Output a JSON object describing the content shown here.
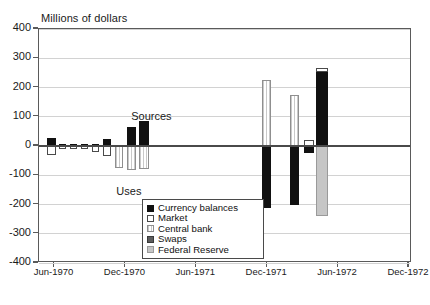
{
  "chart_data": {
    "type": "bar",
    "title": "",
    "ylabel": "Millions of dollars",
    "xlabel": "",
    "ylim": [
      -400,
      400
    ],
    "ytick_values": [
      400,
      300,
      200,
      100,
      0,
      -100,
      -200,
      -300,
      -400
    ],
    "ytick_labels": [
      "400",
      "300",
      "200",
      "100",
      "0",
      "-100",
      "-200",
      "-300",
      "-400"
    ],
    "xtick_labels": [
      "Jun-1970",
      "Dec-1970",
      "Jun-1971",
      "Dec-1971",
      "Jun-1972",
      "Dec-1972"
    ],
    "grid": true,
    "legend_position": "lower-center",
    "annotations": [
      {
        "text": "Sources",
        "x": 0.25,
        "y": 95
      },
      {
        "text": "Uses",
        "x": 0.21,
        "y": -160
      }
    ],
    "series": [
      {
        "name": "Currency balances",
        "color": "#111111",
        "key": "currency"
      },
      {
        "name": "Market",
        "color": "#ffffff",
        "key": "market"
      },
      {
        "name": "Central bank",
        "color": "#dddddd",
        "key": "central"
      },
      {
        "name": "Swaps",
        "color": "#5c5c5c",
        "key": "swaps"
      },
      {
        "name": "Federal Reserve",
        "color": "#c6c6c6",
        "key": "fed"
      }
    ],
    "bars": [
      {
        "series": "currency",
        "x": 45.5,
        "w": 9,
        "v0": 0,
        "v1": 27
      },
      {
        "series": "market",
        "x": 45.5,
        "w": 9,
        "v0": 0,
        "v1": -30
      },
      {
        "series": "currency",
        "x": 57.5,
        "w": 7.5,
        "v0": 0,
        "v1": 6
      },
      {
        "series": "market",
        "x": 57.5,
        "w": 7.5,
        "v0": 0,
        "v1": -9
      },
      {
        "series": "currency",
        "x": 68.5,
        "w": 7.5,
        "v0": 0,
        "v1": 7
      },
      {
        "series": "market",
        "x": 68.5,
        "w": 7.5,
        "v0": 0,
        "v1": -11
      },
      {
        "series": "currency",
        "x": 79.5,
        "w": 7.5,
        "v0": 0,
        "v1": 7
      },
      {
        "series": "market",
        "x": 79.5,
        "w": 7.5,
        "v0": 0,
        "v1": -9
      },
      {
        "series": "currency",
        "x": 90.5,
        "w": 7.5,
        "v0": 0,
        "v1": 7
      },
      {
        "series": "market",
        "x": 90.5,
        "w": 7.5,
        "v0": 0,
        "v1": -22
      },
      {
        "series": "currency",
        "x": 102,
        "w": 8,
        "v0": 0,
        "v1": 25
      },
      {
        "series": "market",
        "x": 102,
        "w": 8,
        "v0": 0,
        "v1": -34
      },
      {
        "series": "currency",
        "x": 114,
        "w": 8,
        "v0": 0,
        "v1": 4
      },
      {
        "series": "central",
        "x": 114,
        "w": 8,
        "v0": 0,
        "v1": -76
      },
      {
        "series": "currency",
        "x": 125.5,
        "w": 9,
        "v0": 0,
        "v1": 66
      },
      {
        "series": "central",
        "x": 125.5,
        "w": 9,
        "v0": 0,
        "v1": -81
      },
      {
        "series": "currency",
        "x": 138,
        "w": 10,
        "v0": 0,
        "v1": 85
      },
      {
        "series": "central",
        "x": 138,
        "w": 10,
        "v0": 0,
        "v1": -78
      },
      {
        "series": "central",
        "x": 261,
        "w": 9,
        "v0": 0,
        "v1": 224
      },
      {
        "series": "currency",
        "x": 261,
        "w": 9,
        "v0": 0,
        "v1": -213
      },
      {
        "series": "central",
        "x": 289,
        "w": 9,
        "v0": 0,
        "v1": 176
      },
      {
        "series": "currency",
        "x": 289,
        "w": 9,
        "v0": 0,
        "v1": -203
      },
      {
        "series": "market",
        "x": 303,
        "w": 10,
        "v0": 0,
        "v1": 22
      },
      {
        "series": "currency",
        "x": 303,
        "w": 10,
        "v0": 0,
        "v1": -24
      },
      {
        "series": "currency",
        "x": 315,
        "w": 12,
        "v0": 0,
        "v1": 252
      },
      {
        "series": "market",
        "x": 315,
        "w": 12,
        "v0": 252,
        "v1": 268
      },
      {
        "series": "fed",
        "x": 315,
        "w": 12,
        "v0": 0,
        "v1": -240
      }
    ]
  },
  "legend": {
    "items": [
      {
        "label": "Currency balances",
        "swatch": "currency"
      },
      {
        "label": "Market",
        "swatch": "market"
      },
      {
        "label": "Central bank",
        "swatch": "central"
      },
      {
        "label": "Swaps",
        "swatch": "swaps"
      },
      {
        "label": "Federal Reserve",
        "swatch": "fed"
      }
    ]
  },
  "caption": {
    "text": ""
  }
}
